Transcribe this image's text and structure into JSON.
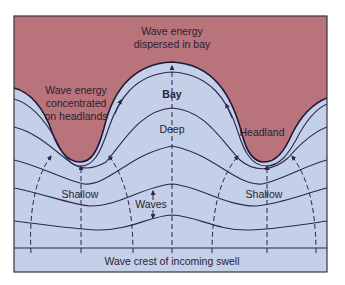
{
  "diagram": {
    "colors": {
      "land": "#b9737b",
      "water": "#c3d0e8",
      "line": "#2e2550",
      "frame": "#3a3340",
      "background": "#ffffff"
    },
    "labels": {
      "dispersed_line1": "Wave energy",
      "dispersed_line2": "dispersed in bay",
      "concentrated_line1": "Wave energy",
      "concentrated_line2": "concentrated",
      "concentrated_line3": "on headlands",
      "bay": "Bay",
      "deep": "Deep",
      "headland": "Headland",
      "shallow_left": "Shallow",
      "shallow_right": "Shallow",
      "waves": "Waves",
      "swell": "Wave crest of incoming swell"
    },
    "elements": {
      "wave_crest_count": 6,
      "orthogonal_count": 7,
      "regions": [
        "land",
        "water"
      ]
    }
  }
}
